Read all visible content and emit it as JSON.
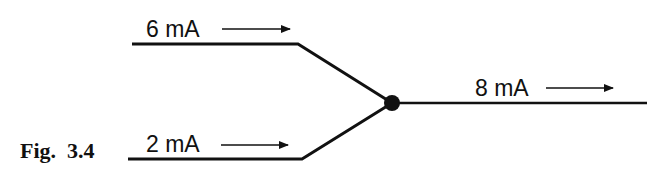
{
  "figure": {
    "caption": "Fig.  3.4",
    "type": "Kirchhoff current law junction"
  },
  "branches": [
    {
      "id": "in-top",
      "label": "6 mA",
      "direction": "into junction"
    },
    {
      "id": "in-bottom",
      "label": "2 mA",
      "direction": "into junction"
    },
    {
      "id": "out",
      "label": "8 mA",
      "direction": "out of junction"
    }
  ],
  "colors": {
    "ink": "#111111",
    "background": "#ffffff"
  }
}
